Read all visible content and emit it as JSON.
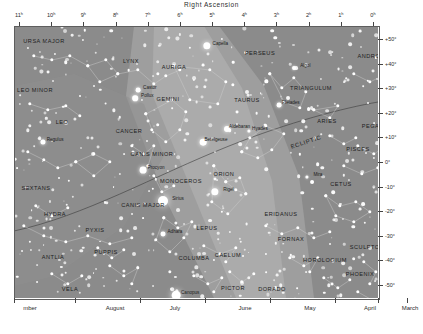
{
  "chart_data": {
    "type": "scatter",
    "title": "Right Ascension",
    "subtitle": "Northern winter star chart",
    "xlabel": "Right Ascension",
    "ylabel": "Declination",
    "x_unit": "hours",
    "y_unit": "degrees",
    "xlim": [
      11,
      0
    ],
    "ylim": [
      -55,
      55
    ],
    "grid": false,
    "legend": "none",
    "x_ticks": [
      "11ʰ",
      "10ʰ",
      "9ʰ",
      "8ʰ",
      "7ʰ",
      "6ʰ",
      "5ʰ",
      "4ʰ",
      "3ʰ",
      "2ʰ",
      "1ʰ",
      "0ʰ"
    ],
    "x_tick_values": [
      11,
      10,
      9,
      8,
      7,
      6,
      5,
      4,
      3,
      2,
      1,
      0
    ],
    "y_ticks": [
      "+50°",
      "+40°",
      "+30°",
      "+20°",
      "+10°",
      "0°",
      "-10°",
      "-20°",
      "-30°",
      "-40°",
      "-50°"
    ],
    "y_tick_values": [
      50,
      40,
      30,
      20,
      10,
      0,
      -10,
      -20,
      -30,
      -40,
      -50
    ],
    "bottom_axis_label": "month of best evening visibility",
    "months": [
      "mber",
      "August",
      "July",
      "June",
      "May",
      "April",
      "March"
    ],
    "month_positions_px": [
      30,
      115,
      175,
      245,
      310,
      370,
      410
    ],
    "annotations": [
      "ECLIPTIC"
    ],
    "constellations": [
      {
        "name": "URSA MAJOR",
        "x": 44,
        "y": 41
      },
      {
        "name": "LYNX",
        "x": 131,
        "y": 61
      },
      {
        "name": "LEO MINOR",
        "x": 35,
        "y": 90
      },
      {
        "name": "LEO",
        "x": 62,
        "y": 122
      },
      {
        "name": "AURIGA",
        "x": 174,
        "y": 67
      },
      {
        "name": "GEMINI",
        "x": 168,
        "y": 99
      },
      {
        "name": "CANCER",
        "x": 129,
        "y": 131
      },
      {
        "name": "CANIS MINOR",
        "x": 152,
        "y": 154
      },
      {
        "name": "MONOCEROS",
        "x": 181,
        "y": 181
      },
      {
        "name": "ORION",
        "x": 224,
        "y": 174
      },
      {
        "name": "TAURUS",
        "x": 247,
        "y": 100
      },
      {
        "name": "PERSEUS",
        "x": 260,
        "y": 53
      },
      {
        "name": "TRIANGULUM",
        "x": 311,
        "y": 88
      },
      {
        "name": "ARIES",
        "x": 327,
        "y": 121
      },
      {
        "name": "ANDROMEDA",
        "x": 378,
        "y": 56
      },
      {
        "name": "PEGASUS",
        "x": 377,
        "y": 126
      },
      {
        "name": "PISCES",
        "x": 358,
        "y": 149
      },
      {
        "name": "CETUS",
        "x": 341,
        "y": 184
      },
      {
        "name": "ERIDANUS",
        "x": 281,
        "y": 214
      },
      {
        "name": "FORNAX",
        "x": 291,
        "y": 239
      },
      {
        "name": "SCULPTOR",
        "x": 367,
        "y": 247
      },
      {
        "name": "PHOENIX",
        "x": 360,
        "y": 274
      },
      {
        "name": "HOROLOGIUM",
        "x": 325,
        "y": 260
      },
      {
        "name": "DORADO",
        "x": 272,
        "y": 289
      },
      {
        "name": "PICTOR",
        "x": 233,
        "y": 288
      },
      {
        "name": "CAELUM",
        "x": 228,
        "y": 255
      },
      {
        "name": "COLUMBA",
        "x": 194,
        "y": 258
      },
      {
        "name": "LEPUS",
        "x": 207,
        "y": 228
      },
      {
        "name": "CANIS MAJOR",
        "x": 143,
        "y": 205
      },
      {
        "name": "PUPPIS",
        "x": 106,
        "y": 252
      },
      {
        "name": "CARINA",
        "x": 143,
        "y": 302
      },
      {
        "name": "VELA",
        "x": 70,
        "y": 289
      },
      {
        "name": "PYXIS",
        "x": 95,
        "y": 230
      },
      {
        "name": "ANTLIA",
        "x": 53,
        "y": 257
      },
      {
        "name": "HYDRA",
        "x": 55,
        "y": 214
      },
      {
        "name": "SEXTANS",
        "x": 36,
        "y": 188
      },
      {
        "name": "TR",
        "x": 5,
        "y": 220
      },
      {
        "name": "NO",
        "x": 3,
        "y": 178
      }
    ],
    "named_stars": [
      {
        "name": "Capella",
        "x": 207,
        "y": 46,
        "mag": 0.1
      },
      {
        "name": "Castor",
        "x": 138,
        "y": 90,
        "mag": 1.6
      },
      {
        "name": "Pollux",
        "x": 135,
        "y": 98,
        "mag": 1.1
      },
      {
        "name": "Algol",
        "x": 294,
        "y": 68,
        "mag": 2.1
      },
      {
        "name": "Pleiades",
        "x": 279,
        "y": 105,
        "mag": 1.6
      },
      {
        "name": "Aldebaran",
        "x": 227,
        "y": 129,
        "mag": 0.9
      },
      {
        "name": "Hyades",
        "x": 249,
        "y": 131,
        "mag": 3.0
      },
      {
        "name": "Betelgeuse",
        "x": 203,
        "y": 142,
        "mag": 0.5
      },
      {
        "name": "Rigel",
        "x": 215,
        "y": 192,
        "mag": 0.1
      },
      {
        "name": "Procyon",
        "x": 143,
        "y": 170,
        "mag": 0.4
      },
      {
        "name": "Regulus",
        "x": 43,
        "y": 142,
        "mag": 1.4
      },
      {
        "name": "Sirius",
        "x": 163,
        "y": 201,
        "mag": -1.5
      },
      {
        "name": "Adhara",
        "x": 163,
        "y": 234,
        "mag": 1.5
      },
      {
        "name": "Mira",
        "x": 307,
        "y": 177,
        "mag": 3.0
      },
      {
        "name": "Canopus",
        "x": 176,
        "y": 295,
        "mag": -0.7
      }
    ]
  },
  "axes": {
    "ra_title": "Right Ascension",
    "dec_title": "Declination"
  }
}
